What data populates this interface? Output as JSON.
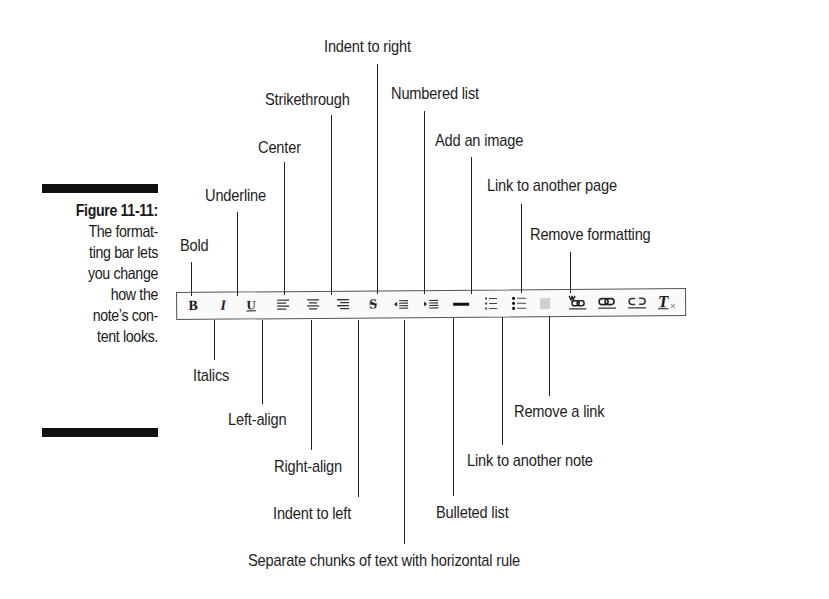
{
  "caption": {
    "figure_label": "Figure 11-11:",
    "lines": [
      "The format-",
      "ting bar lets",
      "you change",
      "how the",
      "note’s con-",
      "tent looks."
    ]
  },
  "toolbar": {
    "buttons": [
      {
        "name": "bold",
        "icon": "bold-icon",
        "glyph": "B"
      },
      {
        "name": "italics",
        "icon": "italic-icon",
        "glyph": "I"
      },
      {
        "name": "underline",
        "icon": "underline-icon",
        "glyph": "U"
      },
      {
        "name": "left-align",
        "icon": "align-left-icon"
      },
      {
        "name": "center",
        "icon": "align-center-icon"
      },
      {
        "name": "right-align",
        "icon": "align-right-icon"
      },
      {
        "name": "strikethrough",
        "icon": "strikethrough-icon",
        "glyph": "S"
      },
      {
        "name": "indent-left",
        "icon": "outdent-icon"
      },
      {
        "name": "indent-right",
        "icon": "indent-icon"
      },
      {
        "name": "horizontal-rule",
        "icon": "horizontal-rule-icon"
      },
      {
        "name": "numbered-list",
        "icon": "numbered-list-icon"
      },
      {
        "name": "bulleted-list",
        "icon": "bulleted-list-icon"
      },
      {
        "name": "add-image",
        "icon": "image-icon"
      },
      {
        "name": "link-note",
        "icon": "link-note-icon"
      },
      {
        "name": "link-page",
        "icon": "link-icon"
      },
      {
        "name": "remove-link",
        "icon": "unlink-icon"
      },
      {
        "name": "remove-formatting",
        "icon": "clear-formatting-icon",
        "glyph": "T"
      }
    ]
  },
  "callouts": {
    "bold": "Bold",
    "underline": "Underline",
    "center": "Center",
    "strikethrough": "Strikethrough",
    "indent_right": "Indent to right",
    "numbered_list": "Numbered list",
    "add_image": "Add an image",
    "link_page": "Link to another page",
    "remove_formatting": "Remove formatting",
    "italics": "Italics",
    "left_align": "Left-align",
    "right_align": "Right-align",
    "indent_left": "Indent to left",
    "horizontal_rule": "Separate chunks of text with horizontal rule",
    "bulleted_list": "Bulleted list",
    "link_note": "Link to another note",
    "remove_link": "Remove a link"
  }
}
